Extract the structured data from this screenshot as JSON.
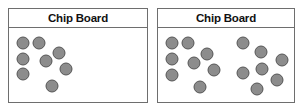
{
  "boards": [
    {
      "title": "Chip Board",
      "chip_color": "#8c8c8c",
      "chips": [
        {
          "x": 14,
          "y": 34
        },
        {
          "x": 30,
          "y": 34
        },
        {
          "x": 14,
          "y": 50
        },
        {
          "x": 37,
          "y": 52
        },
        {
          "x": 50,
          "y": 44
        },
        {
          "x": 14,
          "y": 65
        },
        {
          "x": 57,
          "y": 60
        },
        {
          "x": 43,
          "y": 77
        }
      ]
    },
    {
      "title": "Chip Board",
      "chip_color": "#8c8c8c",
      "chips": [
        {
          "x": 14,
          "y": 34
        },
        {
          "x": 30,
          "y": 34
        },
        {
          "x": 14,
          "y": 50
        },
        {
          "x": 36,
          "y": 54
        },
        {
          "x": 49,
          "y": 45
        },
        {
          "x": 14,
          "y": 66
        },
        {
          "x": 56,
          "y": 61
        },
        {
          "x": 42,
          "y": 78
        },
        {
          "x": 85,
          "y": 34
        },
        {
          "x": 103,
          "y": 43
        },
        {
          "x": 124,
          "y": 51
        },
        {
          "x": 85,
          "y": 64
        },
        {
          "x": 104,
          "y": 60
        },
        {
          "x": 119,
          "y": 71
        },
        {
          "x": 99,
          "y": 80
        }
      ]
    }
  ]
}
